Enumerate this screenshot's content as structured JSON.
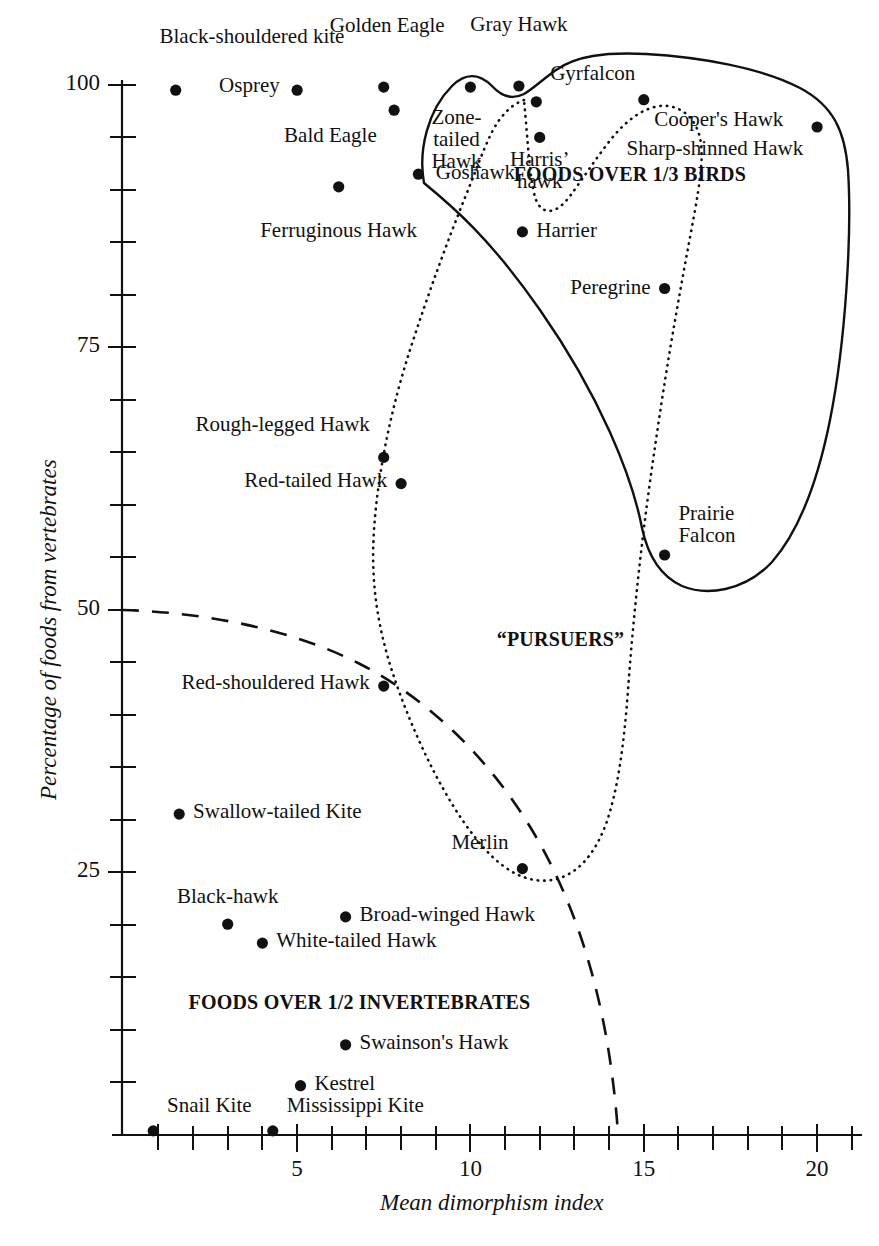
{
  "chart_data": {
    "type": "scatter",
    "title": "",
    "xlabel": "Mean dimorphism index",
    "ylabel": "Percentage of foods from vertebrates",
    "xlim": [
      0,
      20.5
    ],
    "ylim": [
      0,
      103
    ],
    "xticks": [
      5,
      10,
      15,
      20
    ],
    "xticklabels": [
      "5",
      "10",
      "15",
      "20"
    ],
    "yticks": [
      25,
      50,
      75,
      100
    ],
    "yticklabels": [
      "25",
      "50",
      "75",
      "100"
    ],
    "grid": false,
    "legend": null,
    "points": [
      {
        "name": "Black-shouldered kite",
        "x": 1.5,
        "y": 99.5,
        "lx": 3.7,
        "ly": 104.5,
        "anchor": "center"
      },
      {
        "name": "Osprey",
        "x": 5.0,
        "y": 99.5,
        "lx": 4.5,
        "ly": 99.8,
        "anchor": "right"
      },
      {
        "name": "Golden Eagle",
        "x": 7.5,
        "y": 99.8,
        "lx": 7.6,
        "ly": 105.5,
        "anchor": "center"
      },
      {
        "name": "Bald Eagle",
        "x": 7.8,
        "y": 97.6,
        "lx": 7.3,
        "ly": 95.0,
        "anchor": "right"
      },
      {
        "name": "Zone-tailed Hawk",
        "x": 10.0,
        "y": 99.8,
        "lx": 9.6,
        "ly": 96.8,
        "anchor": "center"
      },
      {
        "name": "Gray Hawk",
        "x": 11.4,
        "y": 99.9,
        "lx": 11.4,
        "ly": 105.6,
        "anchor": "center"
      },
      {
        "name": "Gyrfalcon",
        "x": 11.9,
        "y": 98.4,
        "lx": 12.3,
        "ly": 101.0,
        "anchor": "left"
      },
      {
        "name": "Cooper's Hawk",
        "x": 15.0,
        "y": 98.6,
        "lx": 15.3,
        "ly": 96.6,
        "anchor": "left"
      },
      {
        "name": "Sharp-shinned Hawk",
        "x": 20.0,
        "y": 96.0,
        "lx": 19.6,
        "ly": 93.8,
        "anchor": "right"
      },
      {
        "name": "Harris' hawk",
        "x": 12.0,
        "y": 95.0,
        "lx": 12.0,
        "ly": 92.8,
        "anchor": "center"
      },
      {
        "name": "Goshawk",
        "x": 8.5,
        "y": 91.5,
        "lx": 9.0,
        "ly": 91.5,
        "anchor": "left"
      },
      {
        "name": "Ferruginous Hawk",
        "x": 6.2,
        "y": 90.3,
        "lx": 6.2,
        "ly": 86.0,
        "anchor": "center"
      },
      {
        "name": "Harrier",
        "x": 11.5,
        "y": 86.0,
        "lx": 11.9,
        "ly": 86.0,
        "anchor": "left"
      },
      {
        "name": "Peregrine",
        "x": 15.6,
        "y": 80.6,
        "lx": 15.2,
        "ly": 80.6,
        "anchor": "right"
      },
      {
        "name": "Rough-legged Hawk",
        "x": 7.5,
        "y": 64.5,
        "lx": 7.1,
        "ly": 67.5,
        "anchor": "right"
      },
      {
        "name": "Red-tailed Hawk",
        "x": 8.0,
        "y": 62.0,
        "lx": 7.6,
        "ly": 62.2,
        "anchor": "right"
      },
      {
        "name": "Prairie Falcon",
        "x": 15.6,
        "y": 55.2,
        "lx": 16.0,
        "ly": 59.0,
        "anchor": "left"
      },
      {
        "name": "Red-shouldered Hawk",
        "x": 7.5,
        "y": 42.7,
        "lx": 7.1,
        "ly": 42.9,
        "anchor": "right"
      },
      {
        "name": "Swallow-tailed Kite",
        "x": 1.6,
        "y": 30.5,
        "lx": 2.0,
        "ly": 30.6,
        "anchor": "left"
      },
      {
        "name": "Merlin",
        "x": 11.5,
        "y": 25.3,
        "lx": 11.1,
        "ly": 27.6,
        "anchor": "right"
      },
      {
        "name": "Broad-winged Hawk",
        "x": 6.4,
        "y": 20.7,
        "lx": 6.8,
        "ly": 20.8,
        "anchor": "left"
      },
      {
        "name": "Black-hawk",
        "x": 3.0,
        "y": 20.0,
        "lx": 3.0,
        "ly": 22.5,
        "anchor": "center"
      },
      {
        "name": "White-tailed Hawk",
        "x": 4.0,
        "y": 18.2,
        "lx": 4.4,
        "ly": 18.3,
        "anchor": "left"
      },
      {
        "name": "Swainson's Hawk",
        "x": 6.4,
        "y": 8.5,
        "lx": 6.8,
        "ly": 8.6,
        "anchor": "left"
      },
      {
        "name": "Kestrel",
        "x": 5.1,
        "y": 4.6,
        "lx": 5.5,
        "ly": 4.7,
        "anchor": "left"
      },
      {
        "name": "Snail Kite",
        "x": 0.85,
        "y": 0.3,
        "lx": 1.25,
        "ly": 2.6,
        "anchor": "left"
      },
      {
        "name": "Mississippi Kite",
        "x": 4.3,
        "y": 0.3,
        "lx": 4.7,
        "ly": 2.6,
        "anchor": "left"
      }
    ],
    "annotations": [
      {
        "text": "FOODS OVER 1/3 BIRDS",
        "x": 14.6,
        "y": 91.3,
        "style": "bold"
      },
      {
        "text": "“PURSUERS”",
        "x": 12.6,
        "y": 47.0,
        "style": "bold"
      },
      {
        "text": "FOODS OVER 1/2 INVERTEBRATES",
        "x": 6.8,
        "y": 12.4,
        "style": "bold"
      }
    ],
    "boundaries": [
      {
        "name": "foods-over-third-birds-region",
        "style": "solid",
        "description": "Closed solid curve enclosing the bird-eating raptors in the upper right"
      },
      {
        "name": "pursuers-region",
        "style": "dotted",
        "description": "Closed dotted loop enclosing the pursuing raptors"
      },
      {
        "name": "invertebrate-divider",
        "style": "dashed",
        "description": "Dashed curve separating the foods-over-1/2-invertebrates region"
      }
    ]
  },
  "colors": {
    "ink": "#111111",
    "background": "#ffffff"
  }
}
